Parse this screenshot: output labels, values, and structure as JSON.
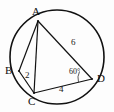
{
  "figure": {
    "background_color": "#fdfdfd",
    "stroke_color": "#111111"
  },
  "vertices": [
    {
      "name": "A",
      "label": "A",
      "x": 38,
      "y": 21,
      "label_x": 32,
      "label_y": 6
    },
    {
      "name": "B",
      "label": "B",
      "x": 19,
      "y": 71,
      "label_x": 5,
      "label_y": 65
    },
    {
      "name": "C",
      "label": "C",
      "x": 34,
      "y": 93,
      "label_x": 28,
      "label_y": 96
    },
    {
      "name": "D",
      "label": "D",
      "x": 92,
      "y": 79,
      "label_x": 97,
      "label_y": 73
    }
  ],
  "segments": [
    {
      "name": "AB",
      "from": "A",
      "to": "B"
    },
    {
      "name": "AC",
      "from": "A",
      "to": "C"
    },
    {
      "name": "AD",
      "from": "A",
      "to": "D"
    },
    {
      "name": "BC",
      "from": "B",
      "to": "C"
    },
    {
      "name": "CD",
      "from": "C",
      "to": "D"
    }
  ],
  "length_labels": [
    {
      "name": "AD",
      "text": "6",
      "x": 71,
      "y": 38
    },
    {
      "name": "BC",
      "text": "2",
      "x": 25,
      "y": 71
    },
    {
      "name": "CD",
      "text": "4",
      "x": 59,
      "y": 85
    }
  ],
  "angle_labels": [
    {
      "name": "angle-at-D",
      "text": "60°",
      "x": 69,
      "y": 68
    }
  ],
  "circle": {
    "name": "circumcircle",
    "cx": 57,
    "cy": 57,
    "r": 47
  }
}
